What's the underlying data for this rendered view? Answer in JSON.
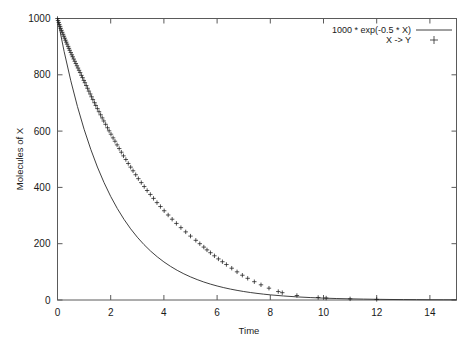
{
  "chart_data": {
    "type": "line",
    "title": "",
    "xlabel": "Time",
    "ylabel": "Molecules of X",
    "xlim": [
      0,
      15
    ],
    "ylim": [
      0,
      1000
    ],
    "grid": false,
    "legend_position": "top-right",
    "xticks": [
      0,
      2,
      4,
      6,
      8,
      10,
      12,
      14
    ],
    "yticks": [
      0,
      200,
      400,
      600,
      800,
      1000
    ],
    "series": [
      {
        "name": "1000 * exp(-0.5 * X)",
        "style": "line",
        "marker": "none",
        "color": "#2a2a2a",
        "formula": "1000 * exp(-0.5 * X)",
        "x": [
          0,
          0.25,
          0.5,
          0.75,
          1,
          1.25,
          1.5,
          1.75,
          2,
          2.25,
          2.5,
          2.75,
          3,
          3.25,
          3.5,
          3.75,
          4,
          4.25,
          4.5,
          4.75,
          5,
          5.25,
          5.5,
          5.75,
          6,
          6.25,
          6.5,
          6.75,
          7,
          7.25,
          7.5,
          7.75,
          8,
          8.5,
          9,
          9.5,
          10,
          10.5,
          11,
          11.5,
          12,
          12.5,
          13,
          13.5,
          14,
          14.5,
          15
        ],
        "values": [
          1000,
          882.5,
          778.8,
          687.3,
          606.5,
          535.3,
          472.4,
          416.9,
          367.9,
          324.7,
          286.5,
          252.8,
          223.1,
          196.9,
          173.8,
          153.4,
          135.3,
          119.4,
          105.4,
          93,
          82.1,
          72.5,
          63.9,
          56.4,
          49.8,
          43.9,
          38.8,
          34.2,
          30.2,
          26.6,
          23.5,
          20.7,
          18.3,
          14.3,
          11.1,
          8.7,
          6.7,
          5.2,
          4.1,
          3.2,
          2.5,
          1.9,
          1.5,
          1.2,
          0.9,
          0.7,
          0.6
        ]
      },
      {
        "name": "X -> Y",
        "style": "points",
        "marker": "+",
        "color": "#1c1c1c",
        "x": [
          0,
          0.02,
          0.05,
          0.07,
          0.1,
          0.12,
          0.15,
          0.18,
          0.21,
          0.24,
          0.27,
          0.3,
          0.33,
          0.36,
          0.4,
          0.43,
          0.46,
          0.5,
          0.54,
          0.57,
          0.61,
          0.65,
          0.69,
          0.73,
          0.77,
          0.81,
          0.85,
          0.9,
          0.94,
          0.99,
          1.03,
          1.08,
          1.13,
          1.18,
          1.23,
          1.28,
          1.33,
          1.39,
          1.44,
          1.5,
          1.56,
          1.62,
          1.68,
          1.74,
          1.81,
          1.88,
          1.94,
          2.01,
          2.09,
          2.16,
          2.24,
          2.32,
          2.4,
          2.48,
          2.57,
          2.66,
          2.75,
          2.84,
          2.94,
          3.04,
          3.15,
          3.26,
          3.37,
          3.49,
          3.61,
          3.74,
          3.87,
          4.01,
          4.16,
          4.31,
          4.47,
          4.64,
          4.82,
          5.0,
          5.2,
          5.35,
          5.5,
          5.62,
          5.75,
          5.9,
          6.05,
          6.2,
          6.35,
          6.55,
          6.75,
          6.95,
          7.15,
          7.4,
          7.65,
          7.95,
          8.3,
          8.45,
          9.0,
          9.8,
          10.1,
          11.0,
          12.0
        ],
        "values": [
          1000,
          993,
          986,
          979,
          972,
          965,
          958,
          951,
          944,
          937,
          930,
          923,
          916,
          909,
          901,
          894,
          887,
          879,
          871,
          864,
          856,
          848,
          840,
          832,
          824,
          816,
          808,
          798,
          790,
          780,
          772,
          762,
          752,
          742,
          732,
          722,
          712,
          701,
          691,
          680,
          669,
          658,
          647,
          636,
          624,
          612,
          601,
          589,
          576,
          564,
          551,
          538,
          525,
          512,
          499,
          485,
          472,
          459,
          445,
          431,
          417,
          403,
          389,
          375,
          361,
          346,
          332,
          317,
          302,
          287,
          272,
          257,
          242,
          227,
          212,
          200,
          188,
          178,
          168,
          157,
          146,
          136,
          126,
          113,
          100,
          88,
          77,
          65,
          54,
          42,
          30,
          26,
          16,
          9,
          7,
          4,
          2
        ]
      }
    ],
    "legend": [
      {
        "label": "1000 * exp(-0.5 * X)",
        "sample": "line"
      },
      {
        "label": "X -> Y",
        "sample": "plus"
      }
    ]
  }
}
